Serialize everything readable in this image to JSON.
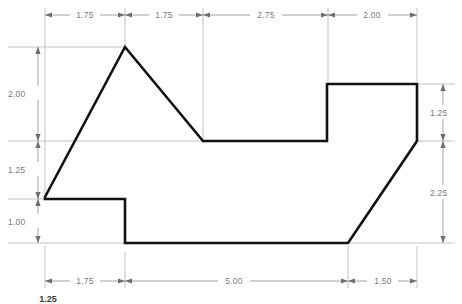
{
  "drawing": {
    "title": "Dimensioned part outline",
    "background_color": "#ffffff",
    "profile_color": "#121212",
    "dimension_color": "#7a7a7a",
    "extension_color": "#b4b4b4"
  },
  "dimensions": {
    "top": [
      {
        "label": "1.75",
        "from_x": 45,
        "to_x": 125
      },
      {
        "label": "1.75",
        "from_x": 125,
        "to_x": 203
      },
      {
        "label": "2.75",
        "from_x": 203,
        "to_x": 328
      },
      {
        "label": "2.00",
        "from_x": 328,
        "to_x": 417
      }
    ],
    "bottom": [
      {
        "label": "1.75",
        "from_x": 45,
        "to_x": 125
      },
      {
        "label": "5.00",
        "from_x": 125,
        "to_x": 348
      },
      {
        "label": "1.50",
        "from_x": 348,
        "to_x": 417
      }
    ],
    "left": [
      {
        "label": "2.00",
        "from_y": 47,
        "to_y": 141
      },
      {
        "label": "1.25",
        "from_y": 141,
        "to_y": 199
      },
      {
        "label": "1.00",
        "from_y": 199,
        "to_y": 243
      }
    ],
    "right": [
      {
        "label": "1.25",
        "from_y": 84,
        "to_y": 141
      },
      {
        "label": "2.25",
        "from_y": 141,
        "to_y": 243
      }
    ],
    "clipped_bottom_left": "1.25"
  },
  "profile": {
    "name": "part-outline",
    "vertices": [
      {
        "x": 45,
        "y": 197,
        "note": "left-lower-vertex"
      },
      {
        "x": 125,
        "y": 47,
        "note": "apex-peak"
      },
      {
        "x": 203,
        "y": 141,
        "note": "valley-bottom"
      },
      {
        "x": 327,
        "y": 141,
        "note": "step-inner-corner"
      },
      {
        "x": 327,
        "y": 84,
        "note": "step-riser-top"
      },
      {
        "x": 417,
        "y": 84,
        "note": "top-right-corner"
      },
      {
        "x": 417,
        "y": 141,
        "note": "right-chamfer-start"
      },
      {
        "x": 348,
        "y": 243,
        "note": "right-chamfer-end"
      },
      {
        "x": 125,
        "y": 243,
        "note": "bottom-left-corner"
      },
      {
        "x": 125,
        "y": 199,
        "note": "notch-riser-top"
      },
      {
        "x": 45,
        "y": 199,
        "note": "notch-left-end"
      }
    ]
  }
}
